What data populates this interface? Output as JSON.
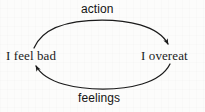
{
  "diagram": {
    "type": "cycle-diagram",
    "title": "",
    "ink_color": "#1b1b1b",
    "background_color": "#fcfcfb",
    "nodes": [
      {
        "id": "node-left",
        "label": "I feel bad"
      },
      {
        "id": "node-right",
        "label": "I overeat"
      }
    ],
    "edges": [
      {
        "id": "edge-top",
        "label": "action",
        "from": "node-left",
        "to": "node-right",
        "direction": "left-to-right",
        "shape": "arc-over"
      },
      {
        "id": "edge-bottom",
        "label": "feelings",
        "from": "node-right",
        "to": "node-left",
        "direction": "right-to-left",
        "shape": "arc-under"
      }
    ]
  }
}
